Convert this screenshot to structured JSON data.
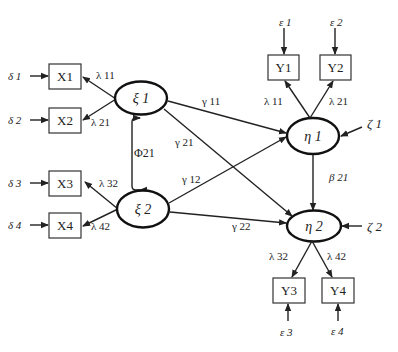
{
  "diagram": {
    "type": "structural-equation-model",
    "colors": {
      "stroke": "#222222",
      "background": "#ffffff"
    },
    "exogenous_latents": [
      {
        "id": "xi1",
        "label": "ξ 1"
      },
      {
        "id": "xi2",
        "label": "ξ 2"
      }
    ],
    "endogenous_latents": [
      {
        "id": "eta1",
        "label": "η 1"
      },
      {
        "id": "eta2",
        "label": "η 2"
      }
    ],
    "x_indicators": [
      {
        "id": "X1",
        "label": "X1",
        "error": "δ 1",
        "loading": "λ 11"
      },
      {
        "id": "X2",
        "label": "X2",
        "error": "δ 2",
        "loading": "λ 21"
      },
      {
        "id": "X3",
        "label": "X3",
        "error": "δ 3",
        "loading": "λ 32"
      },
      {
        "id": "X4",
        "label": "X4",
        "error": "δ 4",
        "loading": "λ 42"
      }
    ],
    "y_indicators": [
      {
        "id": "Y1",
        "label": "Y1",
        "error": "ε 1",
        "loading": "λ 11"
      },
      {
        "id": "Y2",
        "label": "Y2",
        "error": "ε 2",
        "loading": "λ 21"
      },
      {
        "id": "Y3",
        "label": "Y3",
        "error": "ε 3",
        "loading": "λ 32"
      },
      {
        "id": "Y4",
        "label": "Y4",
        "error": "ε 4",
        "loading": "λ 42"
      }
    ],
    "disturbances": [
      {
        "target": "eta1",
        "label": "ζ 1"
      },
      {
        "target": "eta2",
        "label": "ζ 2"
      }
    ],
    "covariance": {
      "between": [
        "xi1",
        "xi2"
      ],
      "label": "Φ21"
    },
    "structural_paths": [
      {
        "from": "xi1",
        "to": "eta1",
        "label": "γ 11"
      },
      {
        "from": "xi1",
        "to": "eta2",
        "label": "γ 21"
      },
      {
        "from": "xi2",
        "to": "eta1",
        "label": "γ 12"
      },
      {
        "from": "xi2",
        "to": "eta2",
        "label": "γ 22"
      },
      {
        "from": "eta1",
        "to": "eta2",
        "label": "β 21"
      }
    ]
  }
}
